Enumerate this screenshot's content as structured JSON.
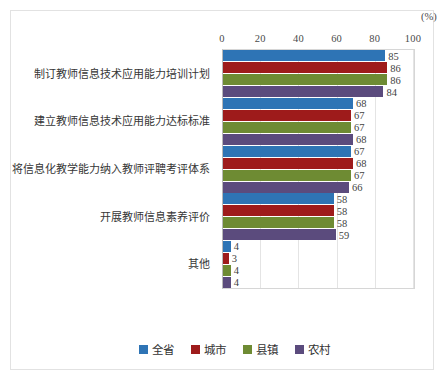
{
  "chart_data": {
    "type": "bar",
    "orientation": "horizontal",
    "title": "",
    "xlabel": "(%)",
    "ylabel": "",
    "xlim": [
      0,
      100
    ],
    "xticks": [
      0,
      20,
      40,
      60,
      80,
      100
    ],
    "unit": "(%)",
    "grid": true,
    "legend_position": "bottom",
    "categories": [
      "制订教师信息技术应用能力培训计划",
      "建立教师信息技术应用能力达标标准",
      "将信息化教学能力纳入教师评聘考评体系",
      "开展教师信息素养评价",
      "其他"
    ],
    "series": [
      {
        "name": "全省",
        "color": "#2E74B5",
        "values": [
          85,
          68,
          67,
          58,
          4
        ]
      },
      {
        "name": "城市",
        "color": "#9E1B1B",
        "values": [
          86,
          67,
          68,
          58,
          3
        ]
      },
      {
        "name": "县镇",
        "color": "#6E8B33",
        "values": [
          86,
          67,
          67,
          58,
          4
        ]
      },
      {
        "name": "农村",
        "color": "#5B4B7D",
        "values": [
          84,
          68,
          66,
          59,
          4
        ]
      }
    ]
  },
  "legend": {
    "items": [
      {
        "label": "全省",
        "color": "#2E74B5"
      },
      {
        "label": "城市",
        "color": "#9E1B1B"
      },
      {
        "label": "县镇",
        "color": "#6E8B33"
      },
      {
        "label": "农村",
        "color": "#5B4B7D"
      }
    ]
  },
  "axis": {
    "ticks": [
      "0",
      "20",
      "40",
      "60",
      "80",
      "100"
    ],
    "unit": "(%)"
  }
}
